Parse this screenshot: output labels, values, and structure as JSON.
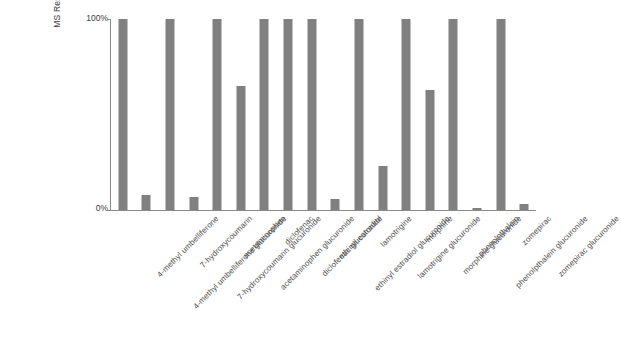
{
  "chart_data": {
    "type": "bar",
    "title": "",
    "xlabel": "",
    "ylabel": "MS Response",
    "ylim": [
      0,
      100
    ],
    "grid": false,
    "legend": null,
    "y_tick_labels": [
      "100%",
      "0%"
    ],
    "y_ticks": [
      100,
      0
    ],
    "categories": [
      "4-methyl umbelliferone",
      "4-methyl umbelliferone glucuronide",
      "7-hydroxycoumarin",
      "7-hydroxycoumarin glucuronide",
      "acetaminophen",
      "acetaminophen glucuronide",
      "diclofenac",
      "diclofenac glucuronide",
      "ethinyl estradiol",
      "ethinyl estradiol glucuronide",
      "lamotrigine",
      "lamotrigine glucuronide",
      "morphine",
      "morphine glucuronide",
      "phenolpthalein",
      "phenolpthalein glucuronide",
      "zomepirac",
      "zomepirac glucuronide"
    ],
    "values": [
      100,
      8,
      100,
      7,
      100,
      65,
      100,
      100,
      100,
      6,
      100,
      23,
      100,
      63,
      100,
      1,
      100,
      3
    ],
    "series": [
      {
        "name": "MS Response",
        "values": [
          100,
          8,
          100,
          7,
          100,
          65,
          100,
          100,
          100,
          6,
          100,
          23,
          100,
          63,
          100,
          1,
          100,
          3
        ]
      }
    ],
    "bar_color": "#808080",
    "axis_color": "#8a8a8a"
  },
  "axis": {
    "y_title": "MS Response",
    "tick_top": "100%",
    "tick_zero": "0%"
  }
}
